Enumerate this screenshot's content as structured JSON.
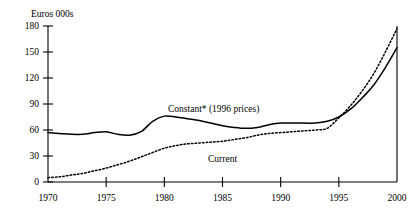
{
  "chart_data": {
    "type": "line",
    "title": "",
    "ylabel": "Euros 000s",
    "xlabel": "",
    "ylim": [
      0,
      180
    ],
    "xlim": [
      1970,
      2000
    ],
    "yticks": [
      0,
      30,
      60,
      90,
      120,
      150,
      180
    ],
    "ytick_labels": [
      "0",
      "30",
      "60",
      "90",
      "120",
      "150",
      "180"
    ],
    "xticks": [
      1970,
      1975,
      1980,
      1985,
      1990,
      1995,
      2000
    ],
    "xtick_labels": [
      "1970",
      "1975",
      "1980",
      "1985",
      "1990",
      "1995",
      "2000"
    ],
    "grid": false,
    "legend_position": "inline-annotation",
    "footnote_marker": "*",
    "x": [
      1970,
      1971,
      1972,
      1973,
      1974,
      1975,
      1976,
      1977,
      1978,
      1979,
      1980,
      1981,
      1982,
      1983,
      1984,
      1985,
      1986,
      1987,
      1988,
      1989,
      1990,
      1991,
      1992,
      1993,
      1994,
      1995,
      1996,
      1997,
      1998,
      1999,
      2000
    ],
    "series": [
      {
        "name": "Constant* (1996 prices)",
        "style": "solid",
        "color": "#000000",
        "annotation": "Constant* (1996 prices)",
        "values": [
          57,
          56,
          55,
          55,
          57,
          58,
          55,
          54,
          58,
          70,
          76,
          75,
          73,
          71,
          68,
          65,
          63,
          62,
          63,
          66,
          68,
          68,
          68,
          68,
          70,
          75,
          84,
          97,
          112,
          132,
          155
        ]
      },
      {
        "name": "Current",
        "style": "dotted",
        "color": "#000000",
        "annotation": "Current",
        "values": [
          5,
          6,
          8,
          10,
          13,
          16,
          20,
          24,
          29,
          34,
          39,
          42,
          44,
          45,
          46,
          47,
          49,
          51,
          54,
          56,
          57,
          58,
          59,
          60,
          62,
          74,
          88,
          105,
          125,
          150,
          177
        ]
      }
    ],
    "annotations": [
      {
        "text": "Constant* (1996 prices)",
        "series": "Constant* (1996 prices)",
        "x_px": 168,
        "y_px": 112
      },
      {
        "text": "Current",
        "series": "Current",
        "x_px": 208,
        "y_px": 162
      }
    ]
  }
}
